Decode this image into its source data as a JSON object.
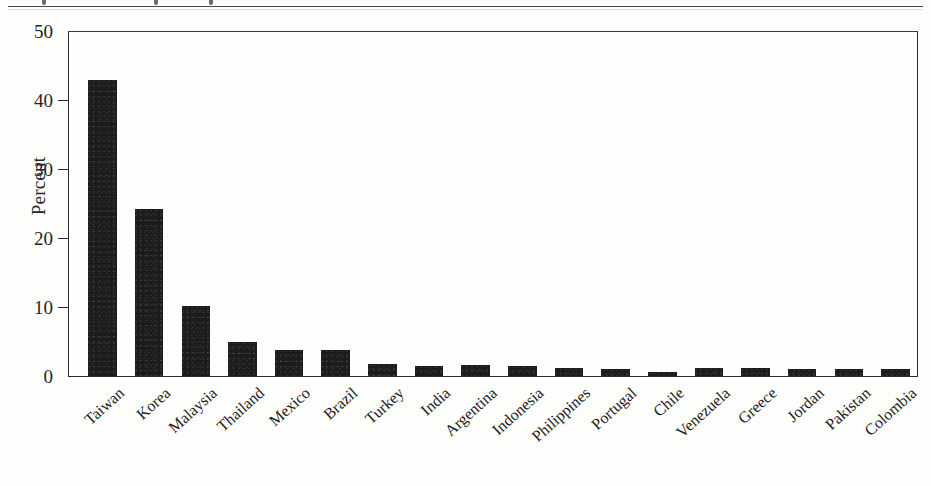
{
  "figure": {
    "top_rule": true,
    "background_color": "#fdfdfc",
    "bar_color": "#1c1c1c",
    "axis_color": "#2b2b2b"
  },
  "chart_data": {
    "type": "bar",
    "title": "",
    "subtitle": "",
    "xlabel": "",
    "ylabel": "Percent",
    "ylim": [
      0,
      50
    ],
    "yticks": [
      0,
      10,
      20,
      30,
      40,
      50
    ],
    "ytick_labels": [
      "0",
      "10",
      "20",
      "30",
      "40",
      "50"
    ],
    "grid": false,
    "legend": false,
    "legend_position": "none",
    "xtick_rotation": -42,
    "categories": [
      "Taiwan",
      "Korea",
      "Malaysia",
      "Thailand",
      "Mexico",
      "Brazil",
      "Turkey",
      "India",
      "Argentina",
      "Indonesia",
      "Philippines",
      "Portugal",
      "Chile",
      "Venezuela",
      "Greece",
      "Jordan",
      "Pakistan",
      "Colombia"
    ],
    "values": [
      42.9,
      24.1,
      10.2,
      4.9,
      3.8,
      3.8,
      1.8,
      1.4,
      1.6,
      1.4,
      1.1,
      1.0,
      0.6,
      1.1,
      1.2,
      1.0,
      1.0,
      1.0
    ],
    "value_unit": "percent"
  }
}
